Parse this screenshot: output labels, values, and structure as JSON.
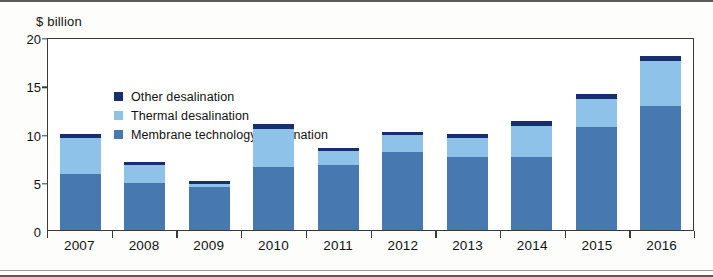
{
  "figure": {
    "y_axis_title": "$ billion"
  },
  "legend": {
    "items": [
      {
        "label": "Other desalination",
        "color": "#17306d",
        "key": "other"
      },
      {
        "label": "Thermal desalination",
        "color": "#8fc2e8",
        "key": "thermal"
      },
      {
        "label": "Membrane technology desalination",
        "color": "#4878b0",
        "key": "membrane"
      }
    ]
  },
  "chart_data": {
    "type": "bar",
    "stacked": true,
    "title": "",
    "subtitle": "",
    "xlabel": "",
    "ylabel": "$ billion",
    "ylim": [
      0,
      20
    ],
    "yticks": [
      0,
      5,
      10,
      15,
      20
    ],
    "ytick_labels": [
      "0",
      "5",
      "10",
      "15",
      "20"
    ],
    "grid": false,
    "legend_position": "top-left inside plot",
    "categories": [
      "2007",
      "2008",
      "2009",
      "2010",
      "2011",
      "2012",
      "2013",
      "2014",
      "2015",
      "2016"
    ],
    "series": [
      {
        "name": "Membrane technology desalination",
        "color": "#4878b0",
        "values": [
          5.8,
          4.9,
          4.5,
          6.5,
          6.7,
          8.1,
          7.6,
          7.6,
          10.7,
          12.8
        ]
      },
      {
        "name": "Thermal desalination",
        "color": "#8fc2e8",
        "values": [
          3.7,
          1.8,
          0.3,
          4.0,
          1.5,
          1.7,
          1.9,
          3.2,
          2.9,
          4.7
        ]
      },
      {
        "name": "Other desalination",
        "color": "#17306d",
        "values": [
          0.5,
          0.3,
          0.3,
          0.5,
          0.3,
          0.4,
          0.4,
          0.5,
          0.5,
          0.5
        ]
      }
    ],
    "totals": [
      10.0,
      7.0,
      5.1,
      11.0,
      8.5,
      10.2,
      9.9,
      11.3,
      14.1,
      18.0
    ]
  }
}
